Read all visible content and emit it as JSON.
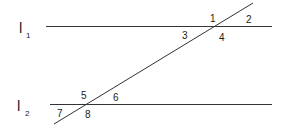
{
  "diagram": {
    "stroke_color": "#333333",
    "lines": {
      "l1": {
        "name": "l",
        "subscript": "1"
      },
      "l2": {
        "name": "l",
        "subscript": "2"
      }
    },
    "angles": [
      "1",
      "2",
      "3",
      "4",
      "5",
      "6",
      "7",
      "8"
    ]
  }
}
